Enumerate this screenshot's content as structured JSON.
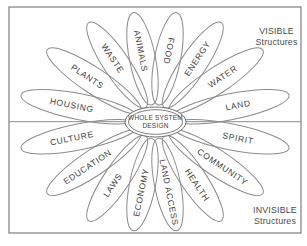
{
  "diagram": {
    "center_label": {
      "line1": "WHOLE SYSTEM",
      "line2": "DESIGN"
    },
    "regions": {
      "visible": {
        "line1": "VISIBLE",
        "line2": "Structures"
      },
      "invisible": {
        "line1": "INVISIBLE",
        "line2": "Structures"
      }
    },
    "petals": [
      {
        "label": "LAND",
        "read": "out"
      },
      {
        "label": "WATER",
        "read": "out"
      },
      {
        "label": "ENERGY",
        "read": "out"
      },
      {
        "label": "FOOD",
        "read": "in"
      },
      {
        "label": "ANIMALS",
        "read": "in"
      },
      {
        "label": "WASTE",
        "read": "in"
      },
      {
        "label": "PLANTS",
        "read": "in"
      },
      {
        "label": "HOUSING",
        "read": "in"
      },
      {
        "label": "CULTURE",
        "read": "in"
      },
      {
        "label": "EDUCATION",
        "read": "in"
      },
      {
        "label": "LAWS",
        "read": "in"
      },
      {
        "label": "ECONOMY",
        "read": "in"
      },
      {
        "label": "LAND ACCESS",
        "read": "out"
      },
      {
        "label": "HEALTH",
        "read": "out"
      },
      {
        "label": "COMMUNITY",
        "read": "out"
      },
      {
        "label": "SPIRIT",
        "read": "out"
      }
    ],
    "colors": {
      "line": "#8c8c8c",
      "border": "#7f7f7f",
      "center_ring": "#6f6f6f",
      "label_text": "#3d3d3d",
      "region_text": "#4a4a4a",
      "background": "#ffffff"
    }
  }
}
